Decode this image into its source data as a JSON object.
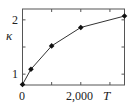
{
  "chart_data": {
    "type": "line",
    "title": "",
    "xlabel": "T",
    "ylabel": "κ",
    "xlim": [
      0,
      3500
    ],
    "ylim": [
      0.8,
      2.2
    ],
    "xticks": [
      0,
      1000,
      2000,
      3000
    ],
    "xtick_labels": [
      "0",
      "",
      "2,000",
      ""
    ],
    "yticks": [
      1,
      1.5,
      2
    ],
    "ytick_labels": [
      "1",
      "",
      "2"
    ],
    "grid": false,
    "series": [
      {
        "name": "κ(T)",
        "x": [
          0,
          290,
          1000,
          2000,
          3500
        ],
        "y": [
          0.81,
          1.09,
          1.52,
          1.86,
          2.07
        ]
      }
    ]
  }
}
